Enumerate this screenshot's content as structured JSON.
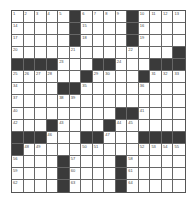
{
  "puzzle": {
    "rows": 15,
    "cols": 15,
    "colors": {
      "black": "#3a3a3a",
      "white": "#ffffff",
      "line": "#666666"
    },
    "grid": [
      [
        "1",
        "2",
        "3",
        "4",
        "5",
        "#",
        "6",
        "7",
        "8",
        "9",
        "#",
        "10",
        "11",
        "12",
        "13"
      ],
      [
        "14",
        "",
        "",
        "",
        "",
        "#",
        "15",
        "",
        "",
        "",
        "#",
        "16",
        "",
        "",
        ""
      ],
      [
        "17",
        "",
        "",
        "",
        "",
        "#",
        "18",
        "",
        "",
        "",
        "#",
        "19",
        "",
        "",
        ""
      ],
      [
        "20",
        "",
        "",
        "",
        "",
        "21",
        "",
        "",
        "",
        "",
        "22",
        "",
        "",
        "",
        "#"
      ],
      [
        "#",
        "#",
        "#",
        "#",
        "23",
        "",
        "",
        "#",
        "#",
        "24",
        "",
        "",
        "#",
        "#",
        "#"
      ],
      [
        "25",
        "26",
        "27",
        "28",
        "",
        "",
        "#",
        "29",
        "30",
        "",
        "",
        "#",
        "31",
        "32",
        "33"
      ],
      [
        "34",
        "",
        "",
        "",
        "#",
        "#",
        "35",
        "",
        "",
        "",
        "",
        "36",
        "",
        "",
        ""
      ],
      [
        "37",
        "",
        "",
        "",
        "38",
        "39",
        "",
        "",
        "",
        "",
        "",
        "",
        "",
        "",
        ""
      ],
      [
        "40",
        "",
        "",
        "",
        "",
        "",
        "",
        "",
        "",
        "#",
        "#",
        "41",
        "",
        "",
        ""
      ],
      [
        "42",
        "",
        "",
        "#",
        "43",
        "",
        "",
        "",
        "#",
        "44",
        "45",
        "",
        "",
        "",
        ""
      ],
      [
        "#",
        "#",
        "#",
        "46",
        "",
        "",
        "#",
        "#",
        "47",
        "",
        "",
        "#",
        "#",
        "#",
        "#"
      ],
      [
        "#",
        "48",
        "49",
        "",
        "",
        "",
        "50",
        "51",
        "",
        "",
        "",
        "52",
        "53",
        "54",
        "55"
      ],
      [
        "56",
        "",
        "",
        "",
        "#",
        "57",
        "",
        "",
        "",
        "#",
        "58",
        "",
        "",
        "",
        ""
      ],
      [
        "59",
        "",
        "",
        "",
        "#",
        "60",
        "",
        "",
        "",
        "#",
        "61",
        "",
        "",
        "",
        ""
      ],
      [
        "62",
        "",
        "",
        "",
        "#",
        "63",
        "",
        "",
        "",
        "#",
        "64",
        "",
        "",
        "",
        ""
      ]
    ]
  }
}
